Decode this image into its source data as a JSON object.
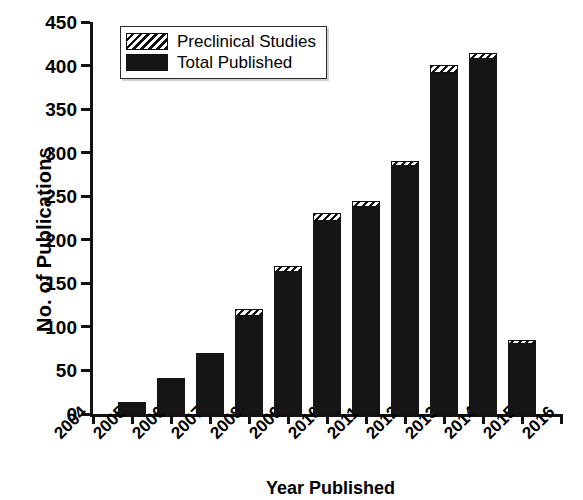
{
  "chart_data": {
    "type": "bar",
    "title": "",
    "subtitle": "",
    "xlabel": "Year Published",
    "ylabel": "No. of Publications",
    "stacked": true,
    "grid": false,
    "legend_position": "top-left",
    "xlim": [
      2004,
      2016
    ],
    "ylim": [
      0,
      450
    ],
    "ytick_step": 50,
    "yticks": [
      450,
      400,
      350,
      300,
      250,
      200,
      150,
      100,
      50,
      0
    ],
    "ytick_labels": [
      "450",
      "400",
      "350",
      "300",
      "250",
      "200",
      "150",
      "100",
      "50",
      "0"
    ],
    "categories": [
      2004,
      2005,
      2006,
      2007,
      2008,
      2009,
      2010,
      2011,
      2012,
      2013,
      2014,
      2015,
      2016
    ],
    "xtick_labels": [
      "2004",
      "2005",
      "2006",
      "2007",
      "2008",
      "2009",
      "2010",
      "2011",
      "2012",
      "2013",
      "2014",
      "2015",
      "2016"
    ],
    "series": [
      {
        "name": "Total Published",
        "style": "solid-black",
        "color": "#151515",
        "values": [
          0,
          14,
          41,
          70,
          112,
          163,
          222,
          238,
          285,
          391,
          408,
          80,
          0
        ]
      },
      {
        "name": "Preclinical Studies",
        "style": "hatched",
        "color": "#ffffff",
        "values": [
          0,
          0,
          0,
          0,
          8,
          7,
          9,
          7,
          5,
          10,
          7,
          5,
          0
        ]
      }
    ],
    "totals": [
      0,
      14,
      41,
      70,
      120,
      170,
      231,
      245,
      290,
      401,
      415,
      85,
      0
    ]
  },
  "legend": {
    "entries": [
      {
        "label": "Preclinical Studies",
        "swatch": "hatched"
      },
      {
        "label": "Total Published",
        "swatch": "solid"
      }
    ]
  },
  "axes": {
    "y_title": "No. of Publications",
    "x_title": "Year Published"
  }
}
